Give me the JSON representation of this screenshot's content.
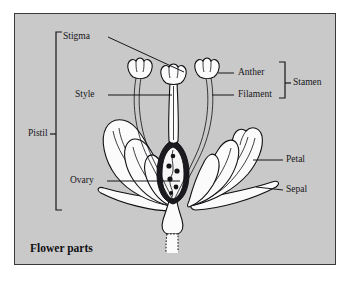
{
  "figure": {
    "title": "Flower parts",
    "panel_background": "#c9c9c9",
    "ink_color": "#17161a",
    "page_background": "#ffffff"
  },
  "labels": {
    "stigma": "Stigma",
    "style": "Style",
    "ovary": "Ovary",
    "anther": "Anther",
    "filament": "Filament",
    "stamen": "Stamen",
    "petal": "Petal",
    "sepal": "Sepal",
    "pistil": "Pistil"
  },
  "groupings": {
    "pistil_members": [
      "Stigma",
      "Style",
      "Ovary"
    ],
    "stamen_members": [
      "Anther",
      "Filament"
    ]
  },
  "parts": [
    {
      "name": "Stigma",
      "side": "left",
      "label_x": 62,
      "label_y": 36,
      "leader": "diagonal"
    },
    {
      "name": "Style",
      "side": "left",
      "label_x": 75,
      "label_y": 95,
      "leader": "horizontal"
    },
    {
      "name": "Ovary",
      "side": "left",
      "label_x": 70,
      "label_y": 181,
      "leader": "horizontal"
    },
    {
      "name": "Anther",
      "side": "right",
      "label_x": 238,
      "label_y": 73,
      "leader": "horizontal"
    },
    {
      "name": "Filament",
      "side": "right",
      "label_x": 238,
      "label_y": 95,
      "leader": "horizontal"
    },
    {
      "name": "Petal",
      "side": "right",
      "label_x": 286,
      "label_y": 160,
      "leader": "horizontal"
    },
    {
      "name": "Sepal",
      "side": "right",
      "label_x": 286,
      "label_y": 190,
      "leader": "horizontal"
    }
  ],
  "brackets": [
    {
      "name": "Pistil",
      "orientation": "left",
      "x": 56,
      "y_top": 32,
      "y_bottom": 210,
      "tick_y": 134
    },
    {
      "name": "Stamen",
      "orientation": "right",
      "x": 285,
      "y_top": 62,
      "y_bottom": 98,
      "tick_y": 83
    }
  ]
}
